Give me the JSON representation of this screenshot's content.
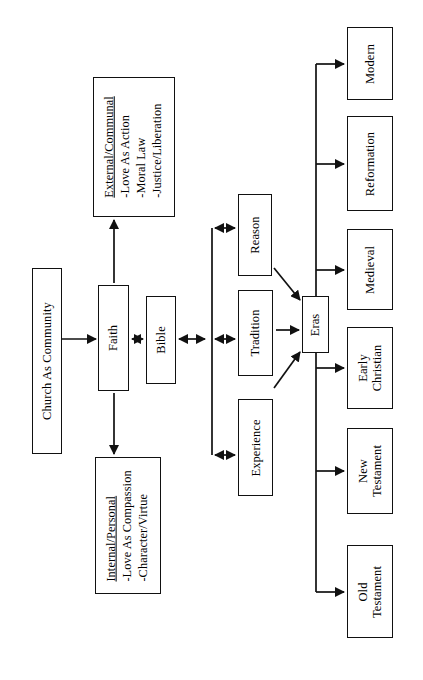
{
  "diagram": {
    "orientation": "rotated-90-ccw",
    "stroke_color": "#111111",
    "background_color": "#ffffff",
    "nodes": {
      "church": {
        "label": "Church As Community"
      },
      "faith": {
        "label": "Faith"
      },
      "bible": {
        "label": "Bible"
      },
      "external": {
        "header": "External/Communal",
        "line1": "-Love As Action",
        "line2": "-Moral Law",
        "line3": "-Justice/Liberation"
      },
      "internal": {
        "header": "Internal/Personal",
        "line1": "-Love As Compassion",
        "line2": "-Character/Virtue"
      },
      "reason": {
        "label": "Reason"
      },
      "tradition": {
        "label": "Tradition"
      },
      "experience": {
        "label": "Experience"
      },
      "eras": {
        "label": "Eras"
      },
      "modern": {
        "label": "Modern"
      },
      "reformation": {
        "label": "Reformation"
      },
      "medieval": {
        "label": "Medieval"
      },
      "early_christian": {
        "line1": "Early",
        "line2": "Christian"
      },
      "new_testament": {
        "line1": "New",
        "line2": "Testament"
      },
      "old_testament": {
        "line1": "Old",
        "line2": "Testament"
      }
    },
    "edges": [
      {
        "from": "church",
        "to": "faith",
        "arrow": "single"
      },
      {
        "from": "faith",
        "to": "external",
        "arrow": "single"
      },
      {
        "from": "faith",
        "to": "internal",
        "arrow": "single"
      },
      {
        "from": "faith",
        "to": "bible",
        "arrow": "double"
      },
      {
        "from": "bible",
        "to": "sources-bracket",
        "arrow": "double"
      },
      {
        "from": "sources-bracket",
        "to": "reason",
        "arrow": "double"
      },
      {
        "from": "sources-bracket",
        "to": "tradition",
        "arrow": "double"
      },
      {
        "from": "sources-bracket",
        "to": "experience",
        "arrow": "double"
      },
      {
        "from": "reason",
        "to": "eras",
        "arrow": "single"
      },
      {
        "from": "tradition",
        "to": "eras",
        "arrow": "single"
      },
      {
        "from": "experience",
        "to": "eras",
        "arrow": "single"
      },
      {
        "from": "eras",
        "to": "modern",
        "arrow": "single"
      },
      {
        "from": "eras",
        "to": "reformation",
        "arrow": "single"
      },
      {
        "from": "eras",
        "to": "medieval",
        "arrow": "single"
      },
      {
        "from": "eras",
        "to": "early_christian",
        "arrow": "single"
      },
      {
        "from": "eras",
        "to": "new_testament",
        "arrow": "single"
      },
      {
        "from": "eras",
        "to": "old_testament",
        "arrow": "single"
      }
    ]
  }
}
